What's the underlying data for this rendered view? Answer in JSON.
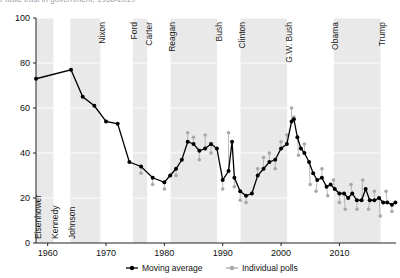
{
  "figure": {
    "title_cut_off": "Public trust in government, 1958-2019",
    "legend_position": "bottom-center"
  },
  "legend": {
    "series": [
      {
        "name": "moving-average",
        "label": "Moving average",
        "color": "#000000",
        "marker": "filled-circle-line"
      },
      {
        "name": "individual-polls",
        "label": "Individual polls",
        "color": "#a8a8a8",
        "marker": "filled-circle-line"
      }
    ]
  },
  "presidents": [
    {
      "name": "Eisenhower",
      "start": 1958.0,
      "end": 1961.0,
      "shaded": true
    },
    {
      "name": "Kennedy",
      "start": 1961.0,
      "end": 1963.9,
      "shaded": false
    },
    {
      "name": "Johnson",
      "start": 1963.9,
      "end": 1969.05,
      "shaded": true
    },
    {
      "name": "Nixon",
      "start": 1969.05,
      "end": 1974.6,
      "shaded": false
    },
    {
      "name": "Ford",
      "start": 1974.6,
      "end": 1977.05,
      "shaded": true
    },
    {
      "name": "Carter",
      "start": 1977.05,
      "end": 1981.05,
      "shaded": false
    },
    {
      "name": "Reagan",
      "start": 1981.05,
      "end": 1989.05,
      "shaded": true
    },
    {
      "name": "Bush",
      "start": 1989.05,
      "end": 1993.05,
      "shaded": false
    },
    {
      "name": "Clinton",
      "start": 1993.05,
      "end": 2001.05,
      "shaded": true
    },
    {
      "name": "G.W. Bush",
      "start": 2001.05,
      "end": 2009.05,
      "shaded": false
    },
    {
      "name": "Obama",
      "start": 2009.05,
      "end": 2017.05,
      "shaded": true
    },
    {
      "name": "Trump",
      "start": 2017.05,
      "end": 2019.7,
      "shaded": false
    }
  ],
  "chart_data": {
    "type": "line",
    "title": "Public trust in government, 1958-2019",
    "xlabel": "",
    "ylabel": "",
    "xlim": [
      1958,
      2019.7
    ],
    "ylim": [
      0,
      100
    ],
    "xticks": [
      1960,
      1970,
      1980,
      1990,
      2000,
      2010
    ],
    "yticks": [
      0,
      20,
      40,
      60,
      80,
      100
    ],
    "grid": "horizontal-light",
    "series": [
      {
        "name": "Moving average",
        "color": "#000000",
        "x": [
          1958.0,
          1964.0,
          1966.0,
          1968.0,
          1970.0,
          1972.0,
          1974.0,
          1976.0,
          1978.0,
          1980.0,
          1981.0,
          1982.0,
          1983.0,
          1984.0,
          1985.0,
          1986.0,
          1987.0,
          1988.0,
          1989.0,
          1990.0,
          1991.0,
          1991.6,
          1992.0,
          1993.0,
          1994.0,
          1995.0,
          1996.0,
          1997.0,
          1998.0,
          1999.0,
          2000.0,
          2001.0,
          2001.8,
          2002.2,
          2002.8,
          2003.4,
          2004.0,
          2004.8,
          2005.5,
          2006.2,
          2007.0,
          2007.8,
          2008.5,
          2009.2,
          2010.0,
          2010.8,
          2011.5,
          2012.2,
          2013.0,
          2013.8,
          2014.5,
          2015.2,
          2016.0,
          2016.8,
          2017.5,
          2018.2,
          2019.0,
          2019.6
        ],
        "y": [
          73,
          77,
          65,
          61,
          54,
          53,
          36,
          34,
          29,
          27,
          30,
          33,
          37,
          45,
          44,
          41,
          42,
          44,
          42,
          28,
          32,
          45,
          29,
          23,
          21,
          22,
          30,
          33,
          36,
          37,
          42,
          44,
          54,
          55,
          47,
          42,
          40,
          36,
          31,
          28,
          29,
          25,
          26,
          24,
          22,
          22,
          20,
          22,
          19,
          19,
          24,
          19,
          19,
          20,
          18,
          18,
          17,
          18
        ]
      },
      {
        "name": "Individual polls",
        "color": "#a8a8a8",
        "x": [
          1976.0,
          1978.0,
          1980.0,
          1982.0,
          1984.0,
          1985.0,
          1986.0,
          1987.0,
          1988.0,
          1990.0,
          1991.0,
          1992.0,
          1993.0,
          1994.0,
          1996.0,
          1997.0,
          1998.0,
          1999.0,
          2000.0,
          2001.0,
          2001.8,
          2002.2,
          2003.0,
          2004.0,
          2005.0,
          2006.0,
          2007.0,
          2008.0,
          2009.0,
          2010.0,
          2011.0,
          2012.0,
          2013.0,
          2014.0,
          2015.0,
          2016.0,
          2017.0,
          2018.0,
          2019.0
        ],
        "y": [
          31,
          26,
          24,
          30,
          49,
          47,
          37,
          48,
          40,
          24,
          49,
          25,
          19,
          18,
          33,
          38,
          40,
          33,
          45,
          48,
          60,
          56,
          39,
          44,
          26,
          23,
          33,
          21,
          28,
          18,
          15,
          26,
          15,
          28,
          15,
          23,
          12,
          23,
          14
        ]
      }
    ]
  }
}
